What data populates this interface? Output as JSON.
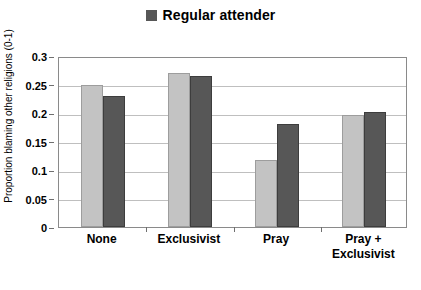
{
  "chart_data": {
    "type": "bar",
    "title": "",
    "subtitle": "",
    "xlabel": "",
    "ylabel": "Proportion blaming other religions (0-1)",
    "ylim": [
      0,
      0.3
    ],
    "ytick_labels": [
      "0",
      "0.05",
      "0.1",
      "0.15",
      "0.2",
      "0.25",
      "0.3"
    ],
    "ytick_values": [
      0,
      0.05,
      0.1,
      0.15,
      0.2,
      0.25,
      0.3
    ],
    "grid": "horizontal",
    "legend_position": "top-center",
    "categories": [
      "None",
      "Exclusivist",
      "Pray",
      "Pray + Exclusivist"
    ],
    "category_lines": [
      [
        "None"
      ],
      [
        "Exclusivist"
      ],
      [
        "Pray"
      ],
      [
        "Pray +",
        "Exclusivist"
      ]
    ],
    "series": [
      {
        "name": "",
        "legend_shown": false,
        "color": "#c3c3c3",
        "values": [
          0.249,
          0.27,
          0.117,
          0.196
        ]
      },
      {
        "name": "Regular attender",
        "legend_shown": true,
        "color": "#575757",
        "values": [
          0.23,
          0.265,
          0.18,
          0.201
        ]
      }
    ]
  },
  "legend": {
    "entries": [
      {
        "label": "Regular attender",
        "swatch_color": "#575757"
      }
    ]
  },
  "colors": {
    "series_light": "#c3c3c3",
    "series_dark": "#575757",
    "gridline": "#bfbfbf",
    "axis": "#8a8a8a",
    "text": "#000000",
    "background": "#ffffff"
  }
}
